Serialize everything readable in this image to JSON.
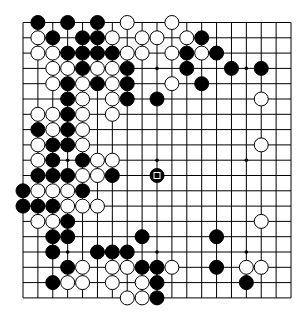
{
  "board": {
    "size": 19,
    "origin_x": 23,
    "origin_y": 22.5,
    "spacing_x": 14.89,
    "spacing_y": 15.3,
    "stone_radius": 7,
    "line_color": "#000000",
    "star_points": [
      [
        3,
        3
      ],
      [
        9,
        3
      ],
      [
        15,
        3
      ],
      [
        3,
        9
      ],
      [
        9,
        9
      ],
      [
        15,
        9
      ],
      [
        3,
        15
      ],
      [
        9,
        15
      ],
      [
        15,
        15
      ]
    ],
    "last_move": {
      "col": 9,
      "row": 10,
      "color": "black",
      "marker": "square"
    }
  },
  "stones": {
    "black": [
      [
        1,
        0
      ],
      [
        3,
        0
      ],
      [
        5,
        0
      ],
      [
        2,
        1
      ],
      [
        4,
        1
      ],
      [
        5,
        1
      ],
      [
        12,
        1
      ],
      [
        3,
        2
      ],
      [
        4,
        2
      ],
      [
        5,
        2
      ],
      [
        6,
        2
      ],
      [
        11,
        2
      ],
      [
        13,
        2
      ],
      [
        4,
        3
      ],
      [
        7,
        3
      ],
      [
        11,
        3
      ],
      [
        14,
        3
      ],
      [
        16,
        3
      ],
      [
        3,
        4
      ],
      [
        5,
        4
      ],
      [
        7,
        4
      ],
      [
        12,
        4
      ],
      [
        3,
        5
      ],
      [
        7,
        5
      ],
      [
        9,
        5
      ],
      [
        3,
        6
      ],
      [
        1,
        7
      ],
      [
        3,
        7
      ],
      [
        2,
        8
      ],
      [
        3,
        8
      ],
      [
        2,
        9
      ],
      [
        4,
        9
      ],
      [
        1,
        10
      ],
      [
        2,
        10
      ],
      [
        3,
        10
      ],
      [
        6,
        10
      ],
      [
        9,
        10
      ],
      [
        0,
        11
      ],
      [
        4,
        11
      ],
      [
        0,
        12
      ],
      [
        1,
        12
      ],
      [
        2,
        12
      ],
      [
        3,
        13
      ],
      [
        2,
        14
      ],
      [
        3,
        14
      ],
      [
        8,
        14
      ],
      [
        13,
        14
      ],
      [
        2,
        15
      ],
      [
        5,
        15
      ],
      [
        6,
        15
      ],
      [
        7,
        15
      ],
      [
        3,
        16
      ],
      [
        8,
        16
      ],
      [
        9,
        16
      ],
      [
        13,
        16
      ],
      [
        2,
        17
      ],
      [
        9,
        17
      ],
      [
        15,
        17
      ],
      [
        9,
        18
      ]
    ],
    "white": [
      [
        7,
        0
      ],
      [
        10,
        0
      ],
      [
        1,
        1
      ],
      [
        6,
        1
      ],
      [
        8,
        1
      ],
      [
        9,
        1
      ],
      [
        11,
        1
      ],
      [
        1,
        2
      ],
      [
        2,
        2
      ],
      [
        7,
        2
      ],
      [
        8,
        2
      ],
      [
        10,
        2
      ],
      [
        12,
        2
      ],
      [
        2,
        3
      ],
      [
        3,
        3
      ],
      [
        5,
        3
      ],
      [
        6,
        3
      ],
      [
        2,
        4
      ],
      [
        4,
        4
      ],
      [
        6,
        4
      ],
      [
        10,
        4
      ],
      [
        4,
        5
      ],
      [
        6,
        5
      ],
      [
        16,
        5
      ],
      [
        1,
        6
      ],
      [
        2,
        6
      ],
      [
        4,
        6
      ],
      [
        6,
        6
      ],
      [
        2,
        7
      ],
      [
        4,
        7
      ],
      [
        1,
        8
      ],
      [
        4,
        8
      ],
      [
        16,
        8
      ],
      [
        1,
        9
      ],
      [
        5,
        9
      ],
      [
        6,
        9
      ],
      [
        4,
        10
      ],
      [
        5,
        10
      ],
      [
        1,
        11
      ],
      [
        2,
        11
      ],
      [
        3,
        11
      ],
      [
        3,
        12
      ],
      [
        4,
        12
      ],
      [
        5,
        12
      ],
      [
        1,
        13
      ],
      [
        2,
        13
      ],
      [
        16,
        13
      ],
      [
        4,
        16
      ],
      [
        6,
        16
      ],
      [
        7,
        16
      ],
      [
        10,
        16
      ],
      [
        15,
        16
      ],
      [
        16,
        16
      ],
      [
        3,
        17
      ],
      [
        4,
        17
      ],
      [
        6,
        17
      ],
      [
        8,
        17
      ],
      [
        7,
        18
      ],
      [
        8,
        18
      ]
    ]
  }
}
